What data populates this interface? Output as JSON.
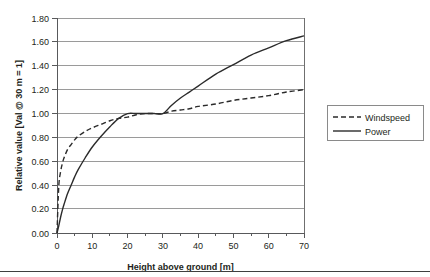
{
  "chart_data": {
    "type": "line",
    "title": "",
    "xlabel": "Height above ground [m]",
    "ylabel": "Relative value [Val @ 30 m = 1]",
    "xlim": [
      0,
      70
    ],
    "ylim": [
      0,
      1.8
    ],
    "grid": "horizontal",
    "legend_position": "right-outside",
    "x_ticks": [
      0,
      10,
      20,
      30,
      40,
      50,
      60,
      70
    ],
    "x_tick_labels": [
      "0",
      "10",
      "20",
      "30",
      "40",
      "50",
      "60",
      "70"
    ],
    "x_minor_tick_step": 5,
    "y_ticks": [
      0.0,
      0.2,
      0.4,
      0.6,
      0.8,
      1.0,
      1.2,
      1.4,
      1.6,
      1.8
    ],
    "y_tick_labels": [
      "0.00",
      "0.20",
      "0.40",
      "0.60",
      "0.80",
      "1.00",
      "1.20",
      "1.40",
      "1.60",
      "1.80"
    ],
    "x": [
      0,
      0.5,
      1,
      1.5,
      2,
      3,
      4,
      5,
      6,
      8,
      10,
      12.5,
      15,
      17.5,
      20,
      22.5,
      25,
      27.5,
      30,
      32.5,
      35,
      37.5,
      40,
      45,
      50,
      55,
      60,
      65,
      70
    ],
    "series": [
      {
        "name": "Windspeed",
        "style": "dashed",
        "color": "#2b2b2b",
        "values": [
          0.0,
          0.39,
          0.51,
          0.58,
          0.63,
          0.7,
          0.74,
          0.78,
          0.81,
          0.85,
          0.88,
          0.91,
          0.94,
          0.96,
          0.97,
          0.99,
          1.0,
          1.0,
          1.0,
          1.02,
          1.03,
          1.04,
          1.06,
          1.08,
          1.11,
          1.13,
          1.15,
          1.18,
          1.2
        ]
      },
      {
        "name": "Power",
        "style": "solid",
        "color": "#2b2b2b",
        "values": [
          0.0,
          0.06,
          0.13,
          0.19,
          0.24,
          0.33,
          0.4,
          0.47,
          0.53,
          0.63,
          0.72,
          0.81,
          0.89,
          0.96,
          1.0,
          1.0,
          1.0,
          1.0,
          1.0,
          1.07,
          1.13,
          1.18,
          1.23,
          1.33,
          1.41,
          1.49,
          1.55,
          1.61,
          1.65
        ]
      }
    ],
    "notes": [
      "Both curves normalized to value 1.00 at 30 m height",
      "Windspeed follows wind-shear power law h^0.14; Power follows h^0.42"
    ]
  },
  "legend": {
    "items": [
      {
        "label": "Windspeed",
        "style": "dashed"
      },
      {
        "label": "Power",
        "style": "solid"
      }
    ]
  },
  "colors": {
    "gridline": "#9a9a9a",
    "axis": "#58595b",
    "curve": "#2b2b2b",
    "text": "#231f20",
    "bottom_rule": "#3f3f3f",
    "legend_border": "#8a8a8a",
    "background": "#ffffff"
  }
}
